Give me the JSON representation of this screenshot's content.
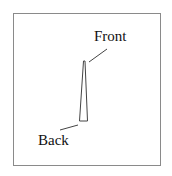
{
  "diagram": {
    "labels": {
      "front": "Front",
      "back": "Back"
    },
    "colors": {
      "frame": "#8a8a8a",
      "stroke": "#444444",
      "text": "#111111"
    }
  }
}
